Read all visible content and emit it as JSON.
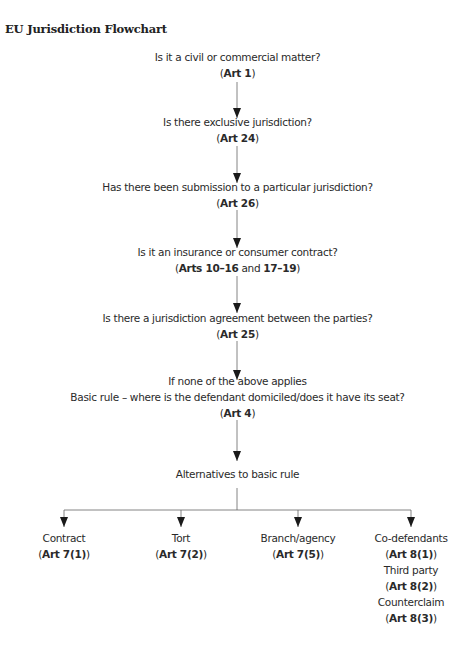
{
  "title": "EU Jurisdiction Flowchart",
  "steps": [
    {
      "question": "Is it a civil or commercial matter?",
      "ref_pre": "(",
      "ref_bold": "Art 1",
      "ref_mid": "",
      "ref_bold2": "",
      "ref_post": ")"
    },
    {
      "question": "Is there exclusive jurisdiction?",
      "ref_pre": "(",
      "ref_bold": "Art 24",
      "ref_mid": "",
      "ref_bold2": "",
      "ref_post": ")"
    },
    {
      "question": "Has there been submission to a particular jurisdiction?",
      "ref_pre": "(",
      "ref_bold": "Art 26",
      "ref_mid": "",
      "ref_bold2": "",
      "ref_post": ")"
    },
    {
      "question": "Is it an insurance or consumer contract?",
      "ref_pre": "(",
      "ref_bold": "Arts 10–16",
      "ref_mid": " and ",
      "ref_bold2": "17–19",
      "ref_post": ")"
    },
    {
      "question": "Is there a jurisdiction agreement between the parties?",
      "ref_pre": "(",
      "ref_bold": "Art 25",
      "ref_mid": "",
      "ref_bold2": "",
      "ref_post": ")"
    },
    {
      "question_line1": "If none of the above applies",
      "question": "Basic rule – where is the defendant domiciled/does it have its seat?",
      "ref_pre": "(",
      "ref_bold": "Art 4",
      "ref_mid": "",
      "ref_bold2": "",
      "ref_post": ")"
    }
  ],
  "alternatives_label": "Alternatives to basic rule",
  "alternatives": [
    {
      "items": [
        {
          "label": "Contract",
          "ref": "Art 7(1)"
        }
      ]
    },
    {
      "items": [
        {
          "label": "Tort",
          "ref": "Art 7(2)"
        }
      ]
    },
    {
      "items": [
        {
          "label": "Branch/agency",
          "ref": "Art 7(5)"
        }
      ]
    },
    {
      "items": [
        {
          "label": "Co-defendants",
          "ref": "Art 8(1)"
        },
        {
          "label": "Third party",
          "ref": "Art 8(2)"
        },
        {
          "label": "Counterclaim",
          "ref": "Art 8(3)"
        }
      ]
    }
  ],
  "colors": {
    "line": "#555555",
    "arrow": "#1a1a1a",
    "text": "#2a2a2a"
  }
}
